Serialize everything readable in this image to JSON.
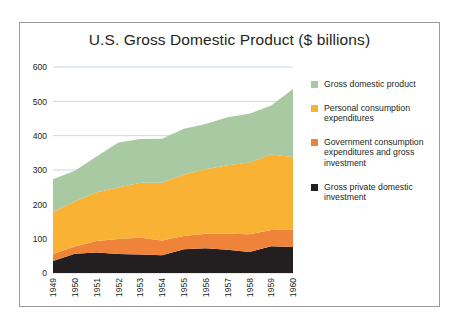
{
  "figure": {
    "title": "U.S. Gross Domestic Product ($ billions)",
    "frame_color": "#9a9a9a",
    "background": "#ffffff"
  },
  "legend": {
    "position": "right",
    "items": [
      {
        "label": "Gross domestic product",
        "color": "#a8c9a1",
        "name": "legend-item-gross-domestic-product"
      },
      {
        "label": "Personal consumption expenditures",
        "color": "#f9b233",
        "name": "legend-item-personal-consumption-expenditures"
      },
      {
        "label": "Government consumption expenditures and gross investment",
        "color": "#f0833a",
        "name": "legend-item-government-consumption"
      },
      {
        "label": "Gross private domestic investment",
        "color": "#231f20",
        "name": "legend-item-gross-private-domestic-investment"
      }
    ]
  },
  "chart_data": {
    "type": "area",
    "title": "U.S. Gross Domestic Product ($ billions)",
    "xlabel": "",
    "ylabel": "",
    "ylim": [
      0,
      600
    ],
    "yticks": [
      0,
      100,
      200,
      300,
      400,
      500,
      600
    ],
    "ytick_labels": [
      "0",
      "100",
      "200",
      "300",
      "400",
      "500",
      "600"
    ],
    "grid": true,
    "stacked": true,
    "categories": [
      "1949",
      "1950",
      "1951",
      "1952",
      "1953",
      "1954",
      "1955",
      "1956",
      "1957",
      "1958",
      "1959",
      "1960"
    ],
    "x": [
      1949,
      1950,
      1951,
      1952,
      1953,
      1954,
      1955,
      1956,
      1957,
      1958,
      1959,
      1960
    ],
    "series": [
      {
        "name": "Gross private domestic investment",
        "color": "#231f20",
        "values": [
          35,
          56,
          60,
          55,
          54,
          52,
          69,
          72,
          68,
          61,
          78,
          76
        ]
      },
      {
        "name": "Government consumption expenditures and gross investment",
        "color": "#f0833a",
        "values": [
          20,
          21,
          33,
          44,
          49,
          43,
          39,
          42,
          46,
          52,
          47,
          51
        ]
      },
      {
        "name": "Personal consumption expenditures",
        "color": "#f9b233",
        "values": [
          123,
          131,
          142,
          150,
          160,
          168,
          179,
          188,
          200,
          209,
          220,
          211
        ]
      },
      {
        "name": "Gross domestic product",
        "color": "#a8c9a1",
        "values": [
          95,
          90,
          104,
          131,
          127,
          128,
          133,
          132,
          140,
          142,
          143,
          198
        ]
      }
    ],
    "series_totals": [
      273,
      298,
      339,
      380,
      390,
      391,
      420,
      434,
      454,
      464,
      488,
      536
    ]
  }
}
